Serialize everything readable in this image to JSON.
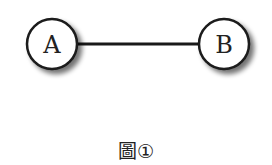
{
  "diagram": {
    "type": "graph",
    "nodes": [
      {
        "id": "A",
        "label": "A"
      },
      {
        "id": "B",
        "label": "B"
      }
    ],
    "edges": [
      {
        "from": "A",
        "to": "B"
      }
    ],
    "caption": "圖①"
  }
}
